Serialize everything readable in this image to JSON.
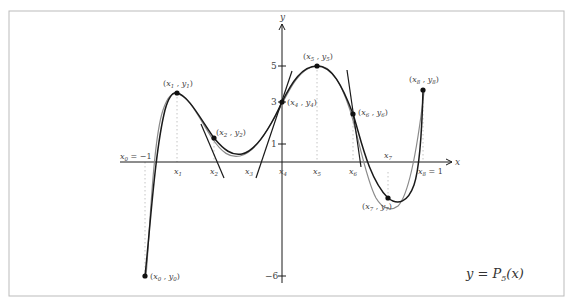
{
  "figure": {
    "equation_label": "y = P",
    "equation_sub": "5",
    "equation_arg": "(x)",
    "axes": {
      "x_label": "x",
      "y_label": "y",
      "y_ticks": [
        "5",
        "3",
        "1",
        "−6"
      ],
      "x_left_label": "x",
      "x_left_sub": "0",
      "x_left_value": " = −1",
      "x_right_label": "x",
      "x_right_sub": "8",
      "x_right_value": " = 1"
    },
    "x_nodes": [
      {
        "name": "x",
        "sub": "1"
      },
      {
        "name": "x",
        "sub": "2"
      },
      {
        "name": "x",
        "sub": "3"
      },
      {
        "name": "x",
        "sub": "4"
      },
      {
        "name": "x",
        "sub": "5"
      },
      {
        "name": "x",
        "sub": "6"
      },
      {
        "name": "x",
        "sub": "7"
      }
    ],
    "points": [
      {
        "label": "(x0 , y0)",
        "x": "x",
        "xs": "0",
        "y": "y",
        "ys": "0"
      },
      {
        "label": "(x1 , y1)",
        "x": "x",
        "xs": "1",
        "y": "y",
        "ys": "1"
      },
      {
        "label": "(x2 , y2)",
        "x": "x",
        "xs": "2",
        "y": "y",
        "ys": "2"
      },
      {
        "label": "(x4 , y4)",
        "x": "x",
        "xs": "4",
        "y": "y",
        "ys": "4"
      },
      {
        "label": "(x5 , y5)",
        "x": "x",
        "xs": "5",
        "y": "y",
        "ys": "5"
      },
      {
        "label": "(x6 , y6)",
        "x": "x",
        "xs": "6",
        "y": "y",
        "ys": "6"
      },
      {
        "label": "(x7 , y7)",
        "x": "x",
        "xs": "7",
        "y": "y",
        "ys": "7"
      },
      {
        "label": "(x8 , y8)",
        "x": "x",
        "xs": "8",
        "y": "y",
        "ys": "8"
      }
    ],
    "colors": {
      "curve_main": "#1a1a1a",
      "curve_approx": "#8a8a8a",
      "frame": "#bbbbbb",
      "dotted": "#bbbbbb"
    }
  }
}
